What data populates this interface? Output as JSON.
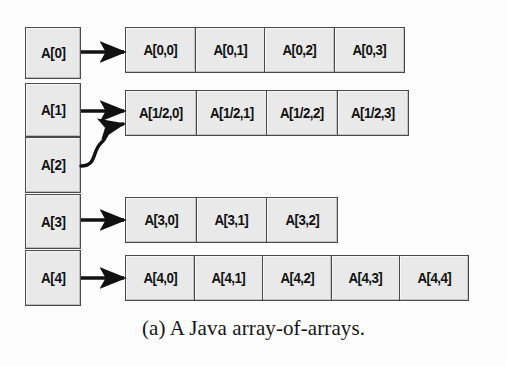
{
  "figure": {
    "caption": "(a) A Java array-of-arrays.",
    "colors": {
      "cell_fill": "#e9e9e9",
      "cell_border": "#4a4a4a",
      "arrow": "#111111",
      "background": "#fdfdfd",
      "text": "#111111"
    }
  },
  "index_column": {
    "name": "outer-array",
    "cells": [
      {
        "label": "A[0]",
        "top": 0,
        "height": 52
      },
      {
        "label": "A[1]",
        "top": 56,
        "height": 54
      },
      {
        "label": "A[2]",
        "top": 110,
        "height": 56
      },
      {
        "label": "A[3]",
        "top": 167,
        "height": 55
      },
      {
        "label": "A[4]",
        "top": 223,
        "height": 56
      }
    ]
  },
  "rows": [
    {
      "name": "row-0",
      "source": "A[0]",
      "left": 125,
      "top": 27,
      "cell_width": 71,
      "arrow": "straight",
      "cells": [
        "A[0,0]",
        "A[0,1]",
        "A[0,2]",
        "A[0,3]"
      ]
    },
    {
      "name": "row-1-2",
      "source": "A[1] and A[2]",
      "left": 125,
      "top": 90,
      "cell_width": 72,
      "arrow": "straight-plus-curved",
      "cells": [
        "A[1/2,0]",
        "A[1/2,1]",
        "A[1/2,2]",
        "A[1/2,3]"
      ]
    },
    {
      "name": "row-3",
      "source": "A[3]",
      "left": 125,
      "top": 197,
      "cell_width": 72,
      "arrow": "straight",
      "cells": [
        "A[3,0]",
        "A[3,1]",
        "A[3,2]"
      ]
    },
    {
      "name": "row-4",
      "source": "A[4]",
      "left": 125,
      "top": 255,
      "cell_width": 70,
      "arrow": "straight",
      "cells": [
        "A[4,0]",
        "A[4,1]",
        "A[4,2]",
        "A[4,3]",
        "A[4,4]"
      ]
    }
  ],
  "arrows": [
    {
      "name": "arrow-a0",
      "from": "A[0]",
      "to": "row-0",
      "type": "straight"
    },
    {
      "name": "arrow-a1",
      "from": "A[1]",
      "to": "row-1-2",
      "type": "straight"
    },
    {
      "name": "arrow-a2",
      "from": "A[2]",
      "to": "row-1-2",
      "type": "curved"
    },
    {
      "name": "arrow-a3",
      "from": "A[3]",
      "to": "row-3",
      "type": "straight"
    },
    {
      "name": "arrow-a4",
      "from": "A[4]",
      "to": "row-4",
      "type": "straight"
    }
  ]
}
